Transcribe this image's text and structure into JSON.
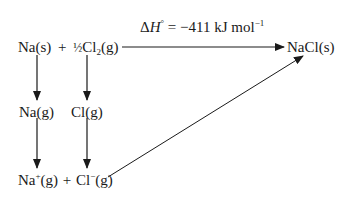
{
  "diagram": {
    "type": "born-haber-cycle",
    "enthalpy_label": {
      "delta": "Δ",
      "symbol": "H",
      "standard": "°",
      "equals": " = ",
      "value": "−411",
      "units": " kJ mol",
      "units_exp": "−1"
    },
    "nodes": {
      "na_s": "Na(s)",
      "plus_top": "+",
      "half": "½",
      "cl2": "Cl",
      "cl2_sub": "2",
      "cl2_state": "(g)",
      "nacl_s": "NaCl(s)",
      "na_g": "Na(g)",
      "cl_g": "Cl(g)",
      "na_ion_el": "Na",
      "na_ion_charge": "+",
      "na_ion_state": "(g)",
      "plus_bottom": "+",
      "cl_ion_el": "Cl",
      "cl_ion_charge": "−",
      "cl_ion_state": "(g)"
    },
    "edges": [
      {
        "from": "Na(s) + ½Cl2(g)",
        "to": "NaCl(s)",
        "label": "ΔH° = −411 kJ mol−1"
      },
      {
        "from": "Na(s)",
        "to": "Na(g)"
      },
      {
        "from": "½Cl2(g)",
        "to": "Cl(g)"
      },
      {
        "from": "Na(g)",
        "to": "Na+(g)"
      },
      {
        "from": "Cl(g)",
        "to": "Cl−(g)"
      },
      {
        "from": "Na+(g) + Cl−(g)",
        "to": "NaCl(s)"
      }
    ]
  }
}
